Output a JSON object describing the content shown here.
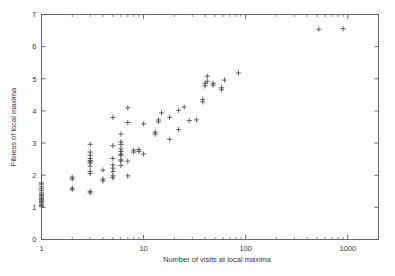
{
  "chart_data": {
    "type": "scatter",
    "title": "",
    "xlabel": "Number of visits at local maxima",
    "ylabel": "Fitness of local maxima",
    "xscale": "log",
    "yscale": "linear",
    "xlim": [
      1,
      2000
    ],
    "ylim": [
      0,
      7
    ],
    "grid": false,
    "legend": null,
    "marker": "plus",
    "marker_color": "#4a4a4a",
    "xticks": [
      1,
      10,
      100,
      1000
    ],
    "xtick_labels": [
      "1",
      "10",
      "100",
      "1000"
    ],
    "xminor_ticks": [
      2,
      3,
      4,
      5,
      6,
      7,
      8,
      9,
      20,
      30,
      40,
      50,
      60,
      70,
      80,
      90,
      200,
      300,
      400,
      500,
      600,
      700,
      800,
      900,
      2000
    ],
    "yticks": [
      0,
      1,
      2,
      3,
      4,
      5,
      6,
      7
    ],
    "ytick_labels": [
      "0",
      "1",
      "2",
      "3",
      "4",
      "5",
      "6",
      "7"
    ],
    "points": [
      [
        1,
        1.02
      ],
      [
        1,
        1.06
      ],
      [
        1,
        1.1
      ],
      [
        1,
        1.14
      ],
      [
        1,
        1.18
      ],
      [
        1,
        1.22
      ],
      [
        1,
        1.25
      ],
      [
        1,
        1.28
      ],
      [
        1,
        1.32
      ],
      [
        1,
        1.36
      ],
      [
        1,
        1.4
      ],
      [
        1,
        1.45
      ],
      [
        1,
        1.52
      ],
      [
        1,
        1.58
      ],
      [
        1,
        1.64
      ],
      [
        1,
        1.72
      ],
      [
        1,
        1.76
      ],
      [
        2,
        1.55
      ],
      [
        2,
        1.6
      ],
      [
        2,
        1.88
      ],
      [
        2,
        1.94
      ],
      [
        3,
        1.45
      ],
      [
        3,
        1.5
      ],
      [
        3,
        2.05
      ],
      [
        3,
        2.12
      ],
      [
        3,
        2.28
      ],
      [
        3,
        2.38
      ],
      [
        3,
        2.42
      ],
      [
        3,
        2.46
      ],
      [
        3,
        2.52
      ],
      [
        3,
        2.62
      ],
      [
        3,
        2.72
      ],
      [
        3,
        2.96
      ],
      [
        4,
        1.82
      ],
      [
        4,
        1.88
      ],
      [
        4,
        2.16
      ],
      [
        5,
        1.92
      ],
      [
        5,
        1.98
      ],
      [
        5,
        2.12
      ],
      [
        5,
        2.22
      ],
      [
        5,
        2.32
      ],
      [
        5,
        2.52
      ],
      [
        5,
        2.92
      ],
      [
        5,
        3.8
      ],
      [
        6,
        2.3
      ],
      [
        6,
        2.44
      ],
      [
        6,
        2.48
      ],
      [
        6,
        2.62
      ],
      [
        6,
        2.66
      ],
      [
        6,
        2.74
      ],
      [
        6,
        2.82
      ],
      [
        6,
        2.96
      ],
      [
        6,
        3.04
      ],
      [
        6,
        3.28
      ],
      [
        7,
        1.98
      ],
      [
        7,
        2.44
      ],
      [
        7,
        3.64
      ],
      [
        7,
        4.1
      ],
      [
        8,
        2.72
      ],
      [
        8,
        2.78
      ],
      [
        9,
        2.74
      ],
      [
        9,
        2.8
      ],
      [
        10,
        2.66
      ],
      [
        10,
        3.6
      ],
      [
        13,
        3.28
      ],
      [
        13,
        3.34
      ],
      [
        14,
        3.66
      ],
      [
        14,
        3.72
      ],
      [
        15,
        3.94
      ],
      [
        18,
        3.12
      ],
      [
        18,
        3.8
      ],
      [
        22,
        3.42
      ],
      [
        22,
        4.02
      ],
      [
        25,
        4.12
      ],
      [
        28,
        3.7
      ],
      [
        33,
        3.72
      ],
      [
        38,
        4.28
      ],
      [
        38,
        4.36
      ],
      [
        40,
        4.78
      ],
      [
        40,
        4.86
      ],
      [
        42,
        4.92
      ],
      [
        42,
        5.08
      ],
      [
        48,
        4.8
      ],
      [
        48,
        4.86
      ],
      [
        58,
        4.66
      ],
      [
        58,
        4.72
      ],
      [
        62,
        4.96
      ],
      [
        85,
        5.18
      ],
      [
        520,
        6.54
      ],
      [
        900,
        6.56
      ]
    ]
  },
  "axes": {
    "x_title": "Number of visits at local maxima",
    "y_title": "Fitness of local maxima"
  }
}
